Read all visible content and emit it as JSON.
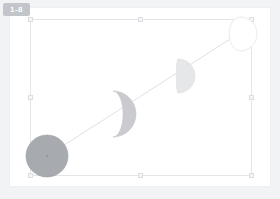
{
  "badge": {
    "label": "1-8",
    "name": "slide-number-badge",
    "color": "#c2c5c9",
    "text_color": "#ffffff"
  },
  "workspace": {
    "background_color": "#f2f3f5",
    "page_background_color": "#ffffff"
  },
  "selection": {
    "border_color": "#e3e5e8",
    "handle_fill": "#f4f5f6",
    "handle_border": "#dcdee1",
    "x": 30,
    "y": 19,
    "width": 222,
    "height": 157,
    "handles": [
      "top-left",
      "top-center",
      "top-right",
      "middle-left",
      "middle-right",
      "bottom-left",
      "bottom-center",
      "bottom-right"
    ]
  },
  "chart_data": {
    "type": "diagram",
    "subtitle": "",
    "xlabel": "",
    "ylabel": "",
    "legend": [],
    "grid": false,
    "connector": {
      "name": "phase-progression-line",
      "kind": "line",
      "color": "#dfe1e4",
      "width": 1,
      "x1": 47,
      "y1": 156,
      "x2": 238,
      "y2": 34
    },
    "categories": [
      "Full",
      "Waning gibbous",
      "Last quarter",
      "Waning crescent"
    ],
    "values": [
      100,
      72,
      45,
      18
    ],
    "series": [
      {
        "name": "illumination_percent",
        "values": [
          100,
          72,
          45,
          18
        ]
      },
      {
        "name": "radius_px",
        "values": [
          21,
          23,
          17,
          17
        ]
      }
    ],
    "points": [
      {
        "label": "Full",
        "illumination": 100,
        "cx": 47,
        "cy": 156,
        "r": 21,
        "fill": "#a7aaae",
        "stroke": "#9a9da2",
        "phase": "full-circle"
      },
      {
        "label": "Waning gibbous",
        "illumination": 72,
        "cx": 113,
        "cy": 114,
        "r": 23,
        "fill": "#c9cbce",
        "stroke": "#c2c4c7",
        "phase": "gibbous"
      },
      {
        "label": "Last quarter",
        "illumination": 45,
        "cx": 178,
        "cy": 76,
        "r": 17,
        "fill": "#e6e7e9",
        "stroke": "#dddee0",
        "phase": "quarter"
      },
      {
        "label": "Waning crescent",
        "illumination": 18,
        "cx": 240,
        "cy": 34,
        "r": 17,
        "fill": "#ffffff",
        "stroke": "#e7e8ea",
        "phase": "thin-crescent"
      }
    ],
    "anchor": {
      "name": "rotation-anchor",
      "x": 47,
      "y": 156,
      "color": "#8d9096"
    }
  }
}
